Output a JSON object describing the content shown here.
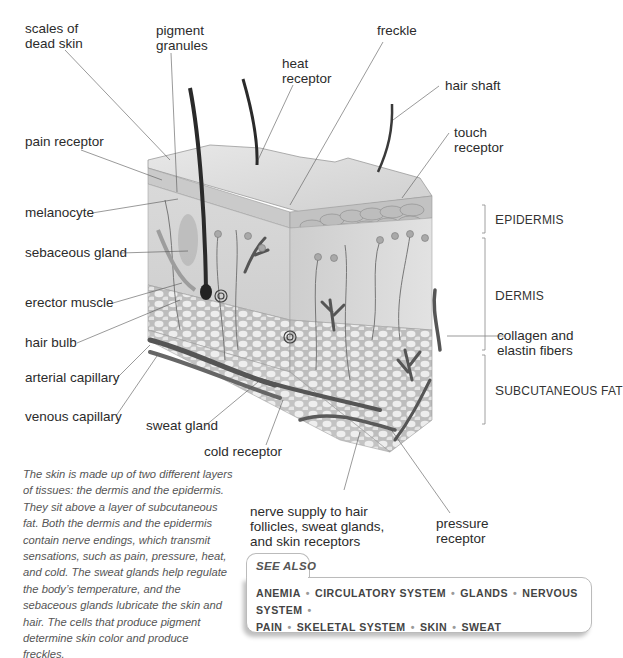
{
  "diagram": {
    "left_labels": [
      {
        "id": "scales",
        "lines": [
          "scales of",
          "dead skin"
        ]
      },
      {
        "id": "pain",
        "lines": [
          "pain receptor"
        ]
      },
      {
        "id": "melanocyte",
        "lines": [
          "melanocyte"
        ]
      },
      {
        "id": "sebaceous",
        "lines": [
          "sebaceous gland"
        ]
      },
      {
        "id": "erector",
        "lines": [
          "erector muscle"
        ]
      },
      {
        "id": "hairbulb",
        "lines": [
          "hair bulb"
        ]
      },
      {
        "id": "arterial",
        "lines": [
          "arterial capillary"
        ]
      },
      {
        "id": "venous",
        "lines": [
          "venous capillary"
        ]
      }
    ],
    "top_labels": [
      {
        "id": "pigment",
        "lines": [
          "pigment",
          "granules"
        ]
      },
      {
        "id": "heat",
        "lines": [
          "heat",
          "receptor"
        ]
      },
      {
        "id": "freckle",
        "lines": [
          "freckle"
        ]
      },
      {
        "id": "hairshaft",
        "lines": [
          "hair shaft"
        ]
      },
      {
        "id": "touch",
        "lines": [
          "touch",
          "receptor"
        ]
      }
    ],
    "right_labels": [
      {
        "id": "collagen",
        "lines": [
          "collagen and",
          "elastin fibers"
        ]
      }
    ],
    "bottom_labels": [
      {
        "id": "sweat",
        "lines": [
          "sweat gland"
        ]
      },
      {
        "id": "cold",
        "lines": [
          "cold receptor"
        ]
      },
      {
        "id": "nerve",
        "lines": [
          "nerve supply to hair",
          "follicles, sweat glands,",
          "and skin receptors"
        ]
      },
      {
        "id": "pressure",
        "lines": [
          "pressure",
          "receptor"
        ]
      }
    ],
    "layers": [
      {
        "id": "epidermis",
        "first": "E",
        "rest": "PIDERMIS"
      },
      {
        "id": "dermis",
        "first": "D",
        "rest": "ERMIS"
      },
      {
        "id": "subcutaneous",
        "first": "S",
        "rest": "UBCUTANEOUS FAT"
      }
    ]
  },
  "caption": "The skin is made up of two different layers of tissues: the dermis and the epidermis. They sit above a layer of subcutaneous fat. Both the dermis and the epidermis contain nerve endings, which transmit sensations, such as pain, pressure, heat, and cold. The sweat glands help regulate the body’s temperature, and the sebaceous glands lubricate the skin and hair. The cells that produce pigment determine skin color and produce freckles.",
  "see_also": {
    "title": "SEE ALSO",
    "items": [
      "ANEMIA",
      "CIRCULATORY SYSTEM",
      "GLANDS",
      "NERVOUS SYSTEM",
      "PAIN",
      "SKELETAL SYSTEM",
      "SKIN",
      "SWEAT"
    ]
  }
}
